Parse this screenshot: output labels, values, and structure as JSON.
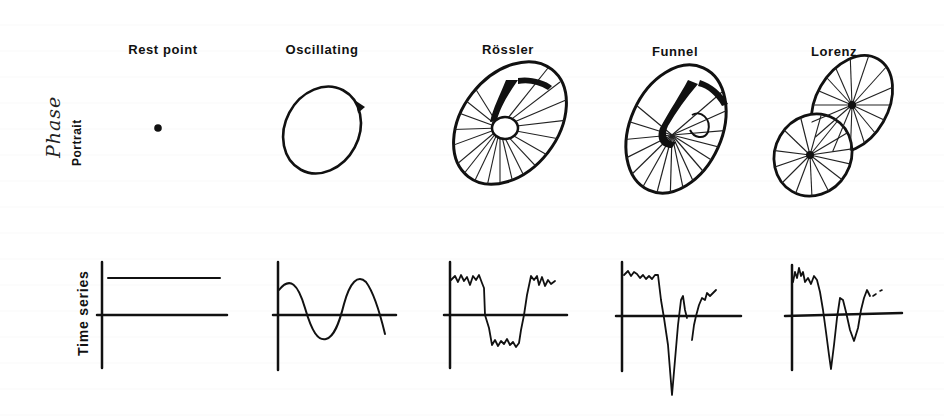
{
  "figure": {
    "row_labels": {
      "phase_handwritten": "Phase",
      "phase_printed": "Portrait",
      "time_series": "Time series"
    },
    "columns": [
      {
        "id": "rest-point",
        "title": "Rest point",
        "phase_portrait": "single fixed point (dot)",
        "time_series": "constant horizontal line above axis"
      },
      {
        "id": "oscillating",
        "title": "Oscillating",
        "phase_portrait": "closed elliptical limit cycle with arrow",
        "time_series": "sinusoidal wave"
      },
      {
        "id": "rossler",
        "title": "Rössler",
        "phase_portrait": "hatched annular chaotic attractor with central hole",
        "time_series": "noisy square-like switching between high and low plateaus"
      },
      {
        "id": "funnel",
        "title": "Funnel",
        "phase_portrait": "hatched funnel attractor with folded inner region",
        "time_series": "noisy plateau then deep spike and irregular recovery"
      },
      {
        "id": "lorenz",
        "title": "Lorenz",
        "phase_portrait": "two-lobed butterfly attractor with radial hatching",
        "time_series": "noisy start then damped irregular oscillation"
      }
    ]
  }
}
